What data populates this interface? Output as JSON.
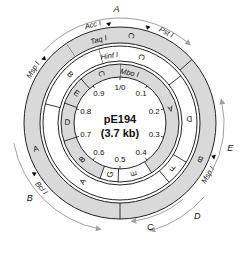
{
  "title": "pE194",
  "size_label": "(3.7 kb)",
  "colors": {
    "ring_fill": "#d9d9d9",
    "ring_stroke": "#222222",
    "arrow": "#a0a0a0",
    "text": "#111111"
  },
  "center": {
    "x": 120,
    "y": 123
  },
  "scale": {
    "radius": 46,
    "ticks": [
      {
        "label": "1/0",
        "pos": 0.0
      },
      {
        "label": "0.1",
        "pos": 0.1
      },
      {
        "label": "0.2",
        "pos": 0.2
      },
      {
        "label": "0.3",
        "pos": 0.3
      },
      {
        "label": "0.4",
        "pos": 0.4
      },
      {
        "label": "0.5",
        "pos": 0.5
      },
      {
        "label": "0.6",
        "pos": 0.6
      },
      {
        "label": "0.7",
        "pos": 0.7
      },
      {
        "label": "0.8",
        "pos": 0.8
      },
      {
        "label": "0.9",
        "pos": 0.9
      }
    ]
  },
  "rings": [
    {
      "enzyme": "Mbo I",
      "r_inner": 46,
      "r_outer": 59,
      "fragments": [
        {
          "label": "A",
          "start": 0.0,
          "end": 0.41,
          "shaded": true
        },
        {
          "label": "E",
          "start": 0.41,
          "end": 0.505,
          "shaded": false
        },
        {
          "label": "G",
          "start": 0.505,
          "end": 0.555,
          "shaded": false
        },
        {
          "label": "B",
          "start": 0.555,
          "end": 0.7,
          "shaded": true
        },
        {
          "label": "D",
          "start": 0.7,
          "end": 0.805,
          "shaded": true
        },
        {
          "label": "E",
          "start": 0.805,
          "end": 0.885,
          "shaded": true
        },
        {
          "label": "C",
          "start": 0.885,
          "end": 1.0,
          "shaded": true
        }
      ]
    },
    {
      "enzyme": "Hinf I",
      "r_inner": 62,
      "r_outer": 77,
      "fragments": [
        {
          "label": "C",
          "start": 0.955,
          "end": 1.145,
          "shaded": false
        },
        {
          "label": "D",
          "start": 0.145,
          "end": 0.335,
          "shaded": false
        },
        {
          "label": "F",
          "start": 0.335,
          "end": 0.39,
          "shaded": false
        },
        {
          "label": "A",
          "start": 0.39,
          "end": 0.79,
          "shaded": false
        },
        {
          "label": "B",
          "start": 0.79,
          "end": 0.955,
          "shaded": false
        }
      ]
    },
    {
      "enzyme": "Taq I",
      "r_inner": 80,
      "r_outer": 96,
      "fragments": [
        {
          "label": "C",
          "start": 0.905,
          "end": 1.135,
          "shaded": true
        },
        {
          "label": "B",
          "start": 0.135,
          "end": 0.5,
          "shaded": true
        },
        {
          "label": "A",
          "start": 0.5,
          "end": 0.905,
          "shaded": true
        }
      ]
    }
  ],
  "ring_labels": [
    {
      "text": "Mbo I",
      "pos": 0.03,
      "r": 51
    },
    {
      "text": "Hinf I",
      "pos": 0.975,
      "r": 68
    },
    {
      "text": "Taq I",
      "pos": 0.96,
      "r": 86
    }
  ],
  "sites": [
    {
      "name": "Acc I",
      "pos": 0.982,
      "label_side": "left"
    },
    {
      "name": "Pst I",
      "pos": 0.045,
      "label_side": "right"
    },
    {
      "name": "Msp I",
      "pos": 0.862,
      "label_side": "left"
    },
    {
      "name": "Msp I",
      "pos": 0.305,
      "label_side": "right"
    },
    {
      "name": "Bcl I",
      "pos": 0.665,
      "label_side": "left"
    }
  ],
  "transcripts": [
    {
      "label": "A",
      "start": 0.87,
      "end": 0.115,
      "r": 105,
      "label_pos": 0.995
    },
    {
      "label": "E",
      "start": 0.33,
      "end": 0.215,
      "r": 104,
      "label_pos": 0.285
    },
    {
      "label": "D",
      "start": 0.365,
      "end": 0.455,
      "r": 112,
      "label_pos": 0.39
    },
    {
      "label": "C",
      "start": 0.39,
      "end": 0.48,
      "r": 99,
      "label_pos": 0.455
    },
    {
      "label": "B",
      "start": 0.72,
      "end": 0.53,
      "r": 108,
      "label_pos": 0.64
    }
  ]
}
